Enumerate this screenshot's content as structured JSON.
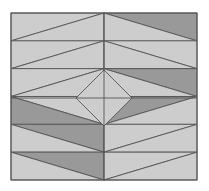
{
  "figure": {
    "type": "tiling-illustration",
    "canvas": {
      "width": 209,
      "height": 191,
      "background": "#ffffff"
    },
    "palette": {
      "light": "#cdcdcd",
      "dark": "#999999",
      "stroke": "#555555",
      "border": "#555555",
      "background": "#ffffff"
    },
    "frame": {
      "x": 11,
      "y": 13,
      "width": 186,
      "height": 167,
      "stroke_width": 1
    },
    "grid": {
      "columns": 2,
      "rows": 6,
      "cell_width": 93,
      "cell_height": 27.8333
    },
    "center_point": {
      "x": 104,
      "y": 98
    },
    "symmetry": "mirror about vertical center line; point symmetry about center",
    "tiles": [
      {
        "name": "r1c1",
        "row": 1,
        "col": 1,
        "diagonal": "bottom-left-to-top-right",
        "upper_fill": "light",
        "lower_fill": "light"
      },
      {
        "name": "r1c2",
        "row": 1,
        "col": 2,
        "diagonal": "top-left-to-bottom-right",
        "upper_fill": "dark",
        "lower_fill": "light"
      },
      {
        "name": "r2c1",
        "row": 2,
        "col": 1,
        "diagonal": "bottom-left-to-top-right",
        "upper_fill": "light",
        "lower_fill": "light"
      },
      {
        "name": "r2c2",
        "row": 2,
        "col": 2,
        "diagonal": "top-left-to-bottom-right",
        "upper_fill": "light",
        "lower_fill": "light"
      },
      {
        "name": "r3c1",
        "row": 3,
        "col": 1,
        "diagonal": "bottom-left-to-top-right",
        "upper_fill": "light",
        "lower_fill": "light"
      },
      {
        "name": "r3c2",
        "row": 3,
        "col": 2,
        "diagonal": "top-left-to-bottom-right",
        "upper_fill": "dark",
        "lower_fill": "light"
      },
      {
        "name": "r4c1",
        "row": 4,
        "col": 1,
        "diagonal": "top-left-to-bottom-right",
        "upper_fill": "light",
        "lower_fill": "dark"
      },
      {
        "name": "r4c2",
        "row": 4,
        "col": 2,
        "diagonal": "bottom-left-to-top-right",
        "upper_fill": "dark",
        "lower_fill": "light"
      },
      {
        "name": "r5c1",
        "row": 5,
        "col": 1,
        "diagonal": "top-left-to-bottom-right",
        "upper_fill": "dark",
        "lower_fill": "light"
      },
      {
        "name": "r5c2",
        "row": 5,
        "col": 2,
        "diagonal": "bottom-left-to-top-right",
        "upper_fill": "light",
        "lower_fill": "light"
      },
      {
        "name": "r6c1",
        "row": 6,
        "col": 1,
        "diagonal": "top-left-to-bottom-right",
        "upper_fill": "dark",
        "lower_fill": "light"
      },
      {
        "name": "r6c2",
        "row": 6,
        "col": 2,
        "diagonal": "bottom-left-to-top-right",
        "upper_fill": "light",
        "lower_fill": "light"
      }
    ],
    "center_diamond": {
      "name": "center-diamond",
      "fill": "light",
      "half_width": 28,
      "half_height": 28,
      "points": "104,70 132,98 104,126 76,98"
    },
    "inner_guides": {
      "vertical_center": {
        "x": 104,
        "y1": 13,
        "y2": 180
      },
      "horizontal_center": {
        "y": 98,
        "x1": 11,
        "x2": 197
      }
    }
  }
}
